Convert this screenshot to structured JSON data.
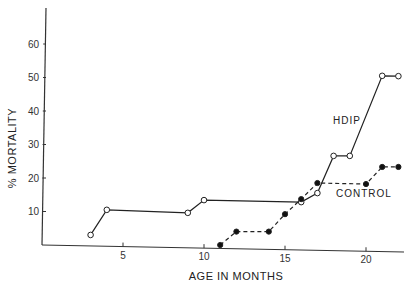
{
  "chart_data": {
    "type": "line",
    "title": "",
    "xlabel": "AGE IN MONTHS",
    "ylabel": "% MORTALITY",
    "xlim": [
      0,
      23
    ],
    "ylim": [
      0,
      70
    ],
    "x_ticks": [
      5,
      10,
      15,
      20
    ],
    "y_ticks": [
      10,
      20,
      30,
      40,
      50,
      60
    ],
    "grid": false,
    "legend": "inline labels",
    "series": [
      {
        "name": "HDIP",
        "marker": "open-circle",
        "line": "solid",
        "points": [
          [
            3,
            3
          ],
          [
            4,
            10.5
          ],
          [
            9,
            9.6
          ],
          [
            10,
            13.4
          ],
          [
            16,
            12.8
          ],
          [
            17,
            15.5
          ],
          [
            18,
            26.6
          ],
          [
            19,
            26.6
          ],
          [
            21,
            50.5
          ],
          [
            22,
            50.4
          ]
        ]
      },
      {
        "name": "CONTROL",
        "marker": "filled-circle",
        "line": "dashed",
        "points": [
          [
            11,
            0
          ],
          [
            12,
            4
          ],
          [
            14,
            4
          ],
          [
            15,
            9.2
          ],
          [
            16,
            13.7
          ],
          [
            17,
            18.5
          ],
          [
            20,
            18.2
          ],
          [
            21,
            23.3
          ],
          [
            22,
            23.3
          ]
        ]
      }
    ]
  },
  "labels": {
    "ylabel": "% MORTALITY",
    "xlabel": "AGE IN MONTHS",
    "hdip": "HDIP",
    "control": "CONTROL"
  }
}
